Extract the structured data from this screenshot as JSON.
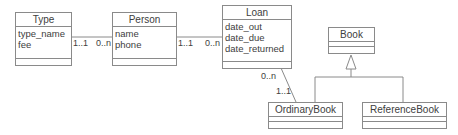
{
  "diagram": {
    "type": "uml-class-diagram",
    "classes": {
      "type": {
        "name": "Type",
        "attributes": [
          "type_name",
          "fee"
        ]
      },
      "person": {
        "name": "Person",
        "attributes": [
          "name",
          "phone"
        ]
      },
      "loan": {
        "name": "Loan",
        "attributes": [
          "date_out",
          "date_due",
          "date_returned"
        ]
      },
      "book": {
        "name": "Book",
        "attributes": []
      },
      "ordinary_book": {
        "name": "OrdinaryBook",
        "attributes": []
      },
      "reference_book": {
        "name": "ReferenceBook",
        "attributes": []
      }
    },
    "associations": {
      "type_person": {
        "from": "Type",
        "to": "Person",
        "from_mult": "1..1",
        "to_mult": "0..n"
      },
      "person_loan": {
        "from": "Person",
        "to": "Loan",
        "from_mult": "1..1",
        "to_mult": "0..n"
      },
      "loan_ordinarybook": {
        "from": "Loan",
        "to": "OrdinaryBook",
        "from_mult": "0..n",
        "to_mult": "1..1"
      }
    },
    "generalizations": [
      {
        "parent": "Book",
        "child": "OrdinaryBook"
      },
      {
        "parent": "Book",
        "child": "ReferenceBook"
      }
    ]
  }
}
